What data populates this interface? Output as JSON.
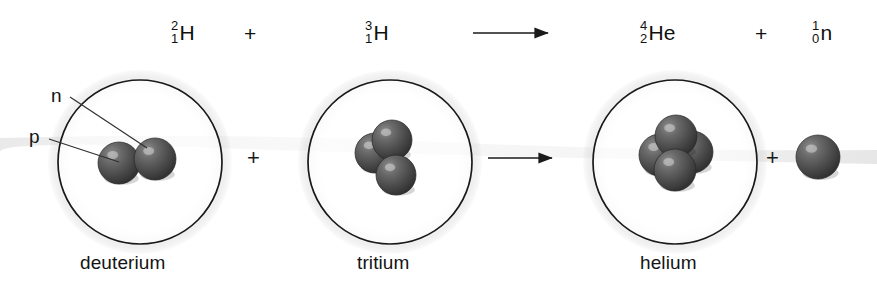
{
  "diagram": {
    "background_color": "#ffffff",
    "sphere_color": "#4a4a4a",
    "outline_color": "#1a1a1a"
  },
  "equation": {
    "terms": [
      {
        "name": "deuterium-nuclide",
        "mass_number": "2",
        "atomic_number": "1",
        "symbol": "H",
        "x": 171,
        "y": 20
      },
      {
        "name": "plus-1",
        "label": "+",
        "x": 244,
        "y": 22
      },
      {
        "name": "tritium-nuclide",
        "mass_number": "3",
        "atomic_number": "1",
        "symbol": "H",
        "x": 365,
        "y": 20
      },
      {
        "name": "helium-nuclide",
        "mass_number": "4",
        "atomic_number": "2",
        "symbol": "He",
        "x": 640,
        "y": 20
      },
      {
        "name": "plus-2",
        "label": "+",
        "x": 755,
        "y": 22
      },
      {
        "name": "neutron-nuclide",
        "mass_number": "1",
        "atomic_number": "0",
        "symbol": "n",
        "x": 812,
        "y": 20
      }
    ]
  },
  "plus_signs": [
    {
      "name": "plus-lower-1",
      "label": "+",
      "x": 247,
      "y": 147
    },
    {
      "name": "plus-lower-2",
      "label": "+",
      "x": 766,
      "y": 147
    }
  ],
  "arrows": [
    {
      "name": "reaction-arrow-top",
      "x1": 473,
      "y1": 33,
      "x2": 548,
      "y2": 33
    },
    {
      "name": "reaction-arrow-main",
      "x1": 488,
      "y1": 158,
      "x2": 552,
      "y2": 158
    }
  ],
  "callouts": [
    {
      "name": "neutron-callout",
      "label": "n",
      "label_x": 51,
      "label_y": 85,
      "line": {
        "x1": 70,
        "y1": 97,
        "x2": 147,
        "y2": 148
      }
    },
    {
      "name": "proton-callout",
      "label": "p",
      "label_x": 29,
      "label_y": 126,
      "line": {
        "x1": 49,
        "y1": 139,
        "x2": 119,
        "y2": 162
      }
    }
  ],
  "atoms": [
    {
      "name": "deuterium-atom",
      "caption": "deuterium",
      "caption_x": 80,
      "caption_y": 252,
      "circle": {
        "cx": 140,
        "cy": 162,
        "r": 82
      },
      "nucleons": [
        {
          "name": "proton-sphere",
          "cx": 119,
          "cy": 163,
          "r": 21
        },
        {
          "name": "neutron-sphere",
          "cx": 155,
          "cy": 159,
          "r": 21
        }
      ]
    },
    {
      "name": "tritium-atom",
      "caption": "tritium",
      "caption_x": 357,
      "caption_y": 252,
      "circle": {
        "cx": 390,
        "cy": 162,
        "r": 82
      },
      "nucleons": [
        {
          "name": "nucleon-sphere",
          "cx": 375,
          "cy": 153,
          "r": 20
        },
        {
          "name": "nucleon-sphere",
          "cx": 392,
          "cy": 140,
          "r": 20
        },
        {
          "name": "nucleon-sphere",
          "cx": 396,
          "cy": 175,
          "r": 20
        }
      ]
    },
    {
      "name": "helium-atom",
      "caption": "helium",
      "caption_x": 640,
      "caption_y": 252,
      "circle": {
        "cx": 675,
        "cy": 162,
        "r": 82
      },
      "nucleons": [
        {
          "name": "nucleon-sphere",
          "cx": 660,
          "cy": 155,
          "r": 21
        },
        {
          "name": "nucleon-sphere",
          "cx": 692,
          "cy": 152,
          "r": 21
        },
        {
          "name": "nucleon-sphere",
          "cx": 676,
          "cy": 136,
          "r": 21
        },
        {
          "name": "nucleon-sphere",
          "cx": 675,
          "cy": 170,
          "r": 21
        }
      ]
    },
    {
      "name": "free-neutron",
      "caption": "",
      "caption_x": 0,
      "caption_y": 0,
      "circle": null,
      "nucleons": [
        {
          "name": "free-neutron-sphere",
          "cx": 818,
          "cy": 157,
          "r": 22
        }
      ]
    }
  ]
}
